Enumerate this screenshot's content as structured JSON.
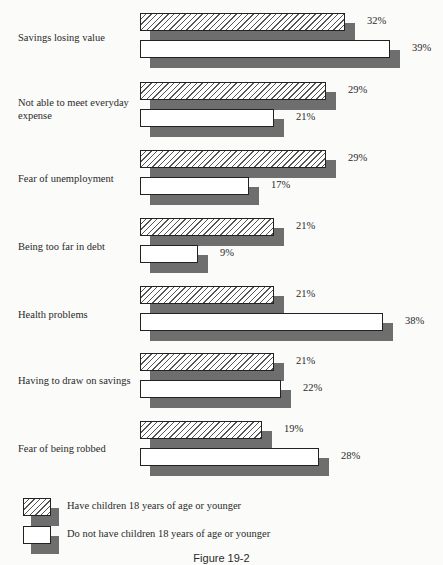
{
  "chart_data": {
    "type": "bar",
    "orientation": "horizontal",
    "title": "",
    "caption": "Figure 19-2",
    "xlabel": "",
    "ylabel": "",
    "grid": false,
    "legend_position": "bottom-left",
    "categories": [
      "Savings losing value",
      "Not able to meet everyday expense",
      "Fear of unemployment",
      "Being too far in debt",
      "Health problems",
      "Having to draw on savings",
      "Fear of being robbed"
    ],
    "series": [
      {
        "name": "Have children 18 years of age or younger",
        "pattern": "hatched",
        "values": [
          32,
          29,
          29,
          21,
          21,
          21,
          19
        ]
      },
      {
        "name": "Do not have children 18 years of age or younger",
        "pattern": "plain",
        "values": [
          39,
          21,
          17,
          9,
          38,
          22,
          28
        ]
      }
    ],
    "value_labels": {
      "hatched": [
        "32%",
        "29%",
        "29%",
        "21%",
        "21%",
        "21%",
        "19%"
      ],
      "plain": [
        "39%",
        "21%",
        "17%",
        "9%",
        "38%",
        "22%",
        "28%"
      ]
    }
  },
  "categories": [
    {
      "label": "Savings losing value"
    },
    {
      "label": "Not able to meet everyday expense"
    },
    {
      "label": "Fear of unemployment"
    },
    {
      "label": "Being too far in debt"
    },
    {
      "label": "Health problems"
    },
    {
      "label": "Having to draw on savings"
    },
    {
      "label": "Fear of being robbed"
    }
  ],
  "legend": {
    "hatched": "Have children 18 years of age or younger",
    "plain": "Do not have children 18 years of age or younger"
  },
  "caption": "Figure 19-2",
  "colors": {
    "bar_fill": "#ffffff",
    "hatch": "#555555",
    "shadow": "#6e6e6e",
    "outline": "#222222"
  }
}
